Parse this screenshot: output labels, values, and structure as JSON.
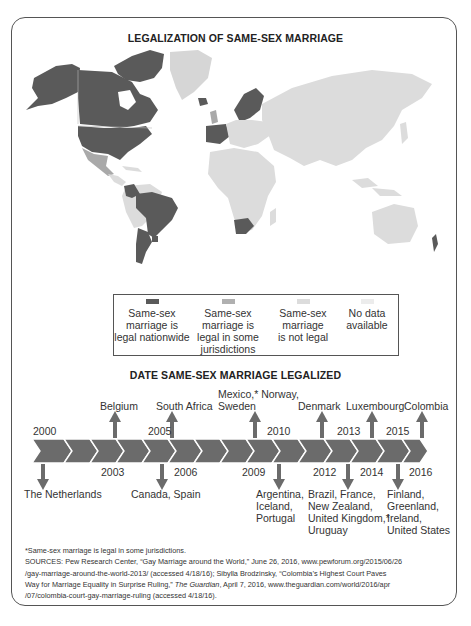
{
  "map_title": "LEGALIZATION OF SAME-SEX MARRIAGE",
  "timeline_title": "DATE SAME-SEX MARRIAGE LEGALIZED",
  "colors": {
    "legal_nationwide": "#5a5a5a",
    "legal_some": "#a9a9a9",
    "not_legal": "#dcdcdc",
    "no_data": "#eeeeee",
    "timeline_arrow": "#6b6b6b",
    "frame": "#555555"
  },
  "legend": [
    {
      "label_lines": [
        "Same-sex",
        "marriage is",
        "legal nationwide"
      ]
    },
    {
      "label_lines": [
        "Same-sex",
        "marriage is",
        "legal in some",
        "jurisdictions"
      ]
    },
    {
      "label_lines": [
        "Same-sex",
        "marriage",
        "is not legal"
      ]
    },
    {
      "label_lines": [
        "No data",
        "available"
      ]
    }
  ],
  "timeline": {
    "years_top": [
      "2000",
      "2005",
      "2010",
      "2013",
      "2015"
    ],
    "years_bottom": [
      "2003",
      "2006",
      "2009",
      "2012",
      "2014",
      "2016"
    ],
    "events_up": [
      {
        "year": "2003",
        "lines": [
          "Belgium"
        ]
      },
      {
        "year": "2006",
        "lines": [
          "South Africa"
        ]
      },
      {
        "year": "2009",
        "lines": [
          "Mexico,* Norway,",
          "Sweden"
        ]
      },
      {
        "year": "2012",
        "lines": [
          "Denmark"
        ]
      },
      {
        "year": "2014",
        "lines": [
          "Luxembourg"
        ]
      },
      {
        "year": "2016",
        "lines": [
          "Colombia"
        ]
      }
    ],
    "events_down": [
      {
        "year": "2000",
        "lines": [
          "The Netherlands"
        ]
      },
      {
        "year": "2005",
        "lines": [
          "Canada, Spain"
        ]
      },
      {
        "year": "2010",
        "lines": [
          "Argentina,",
          "Iceland,",
          "Portugal"
        ]
      },
      {
        "year": "2013",
        "lines": [
          "Brazil, France,",
          "New Zealand,",
          "United Kingdom,*",
          "Uruguay"
        ]
      },
      {
        "year": "2015",
        "lines": [
          "Finland,",
          "Greenland,",
          "Ireland,",
          "United States"
        ]
      }
    ]
  },
  "notes": {
    "footnote": "*Same-sex marriage is legal in some jurisdictions.",
    "sources_1": "SOURCES: Pew Research Center, “Gay Marriage around the World,” June 26, 2016, www.pewforum.org/2015/06/26",
    "sources_2": "/gay-marriage-around-the-world-2013/ (accessed 4/18/16); Sibylla Brodzinsky, “Colombia’s Highest Court Paves",
    "sources_3a": "Way for Marriage Equality in Surprise Ruling,” ",
    "sources_3b": "The Guardian",
    "sources_3c": ", April 7, 2016, www.theguardian.com/world/2016/apr",
    "sources_4": "/07/colombia-court-gay-marriage-ruling (accessed 4/18/16)."
  }
}
